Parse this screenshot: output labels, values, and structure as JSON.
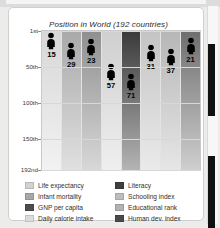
{
  "chart_data": {
    "type": "bar",
    "title": "Position in World (192 countries)",
    "xlabel": "",
    "ylabel": "",
    "ylim": [
      1,
      192
    ],
    "y_inverted": true,
    "grid": true,
    "legend_position": "bottom",
    "ytick_labels": [
      "1st",
      "50th",
      "100th",
      "150th",
      "192nd"
    ],
    "ytick_values": [
      1,
      50,
      100,
      150,
      192
    ],
    "categories": [
      "Life expectancy",
      "Infant mortality",
      "GNP per capita",
      "Daily calorie intake",
      "Literacy",
      "Schooling index",
      "Educational rank",
      "Human dev. index"
    ],
    "values": [
      15,
      29,
      23,
      57,
      71,
      31,
      37,
      21
    ],
    "band_colors_top": [
      "#d7d7d7",
      "#a9a9a9",
      "#8f8f8f",
      "#cfcfcf",
      "#3a3a3a",
      "#c4c4c4",
      "#b6b6b6",
      "#6e6e6e"
    ],
    "band_colors_bottom": [
      "#f2f2f2",
      "#e0e0e0",
      "#d8d8d8",
      "#efefef",
      "#b4b4b4",
      "#eaeaea",
      "#e6e6e6",
      "#cfcfcf"
    ]
  },
  "legend": {
    "left_column": [
      {
        "label": "Life expectancy",
        "color": "#d2d2d2"
      },
      {
        "label": "Infant mortality",
        "color": "#a8a8a8"
      },
      {
        "label": "GNP per capita",
        "color": "#4d4d4d"
      },
      {
        "label": "Daily calorie intake",
        "color": "#dcdcdc"
      }
    ],
    "right_column": [
      {
        "label": "Literacy",
        "color": "#3f3f3f"
      },
      {
        "label": "Schooling index",
        "color": "#bdbdbd"
      },
      {
        "label": "Educational rank",
        "color": "#b2b2b2"
      },
      {
        "label": "Human dev. index",
        "color": "#4a4a4a"
      }
    ]
  },
  "scrollbar": {
    "thumb_color": "#111111",
    "track_color": "#f7f7f7"
  }
}
